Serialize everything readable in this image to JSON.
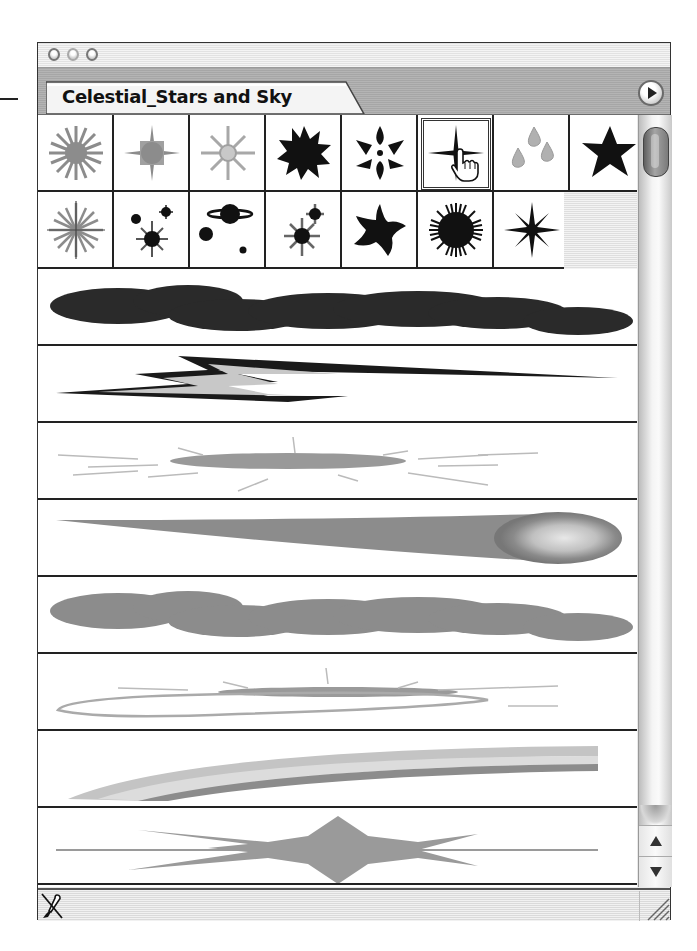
{
  "window": {
    "title_buttons": [
      "close",
      "minimize",
      "zoom"
    ],
    "tab_label": "Celestial_Stars and Sky",
    "menu_button_icon": "triangle-right-icon"
  },
  "brush_library": {
    "name": "Celestial_Stars and Sky",
    "selected_index": 5,
    "scatter_brushes": [
      {
        "name": "gray-sunburst-star",
        "icon": "sunburst-icon"
      },
      {
        "name": "gray-four-point-glow-star",
        "icon": "four-point-glow-icon"
      },
      {
        "name": "light-gray-eight-point-star",
        "icon": "eight-point-star-icon"
      },
      {
        "name": "black-twelve-point-star",
        "icon": "burst-star-icon"
      },
      {
        "name": "black-flower-star",
        "icon": "flower-star-icon"
      },
      {
        "name": "black-four-point-sparkle",
        "icon": "sparkle-icon"
      },
      {
        "name": "gray-droplets",
        "icon": "droplets-icon"
      },
      {
        "name": "black-five-point-star",
        "icon": "star-icon"
      },
      {
        "name": "gray-compass-starburst",
        "icon": "compass-star-icon"
      },
      {
        "name": "black-star-cluster",
        "icon": "star-cluster-icon"
      },
      {
        "name": "black-planets",
        "icon": "planets-icon"
      },
      {
        "name": "black-double-star-burst",
        "icon": "double-star-icon"
      },
      {
        "name": "black-curved-star",
        "icon": "curved-star-icon"
      },
      {
        "name": "black-spiky-sun",
        "icon": "spiky-sun-icon"
      },
      {
        "name": "black-eight-point-sparkle",
        "icon": "eight-point-sparkle-icon"
      }
    ],
    "art_brushes": [
      {
        "name": "dark-cloud",
        "icon": "cloud-stroke-icon"
      },
      {
        "name": "lightning-bolt",
        "icon": "lightning-stroke-icon"
      },
      {
        "name": "gray-nebula-streaks",
        "icon": "nebula-stroke-icon"
      },
      {
        "name": "comet",
        "icon": "comet-stroke-icon"
      },
      {
        "name": "gray-cloud",
        "icon": "cloud-stroke-icon"
      },
      {
        "name": "galaxy-ring",
        "icon": "galaxy-stroke-icon"
      },
      {
        "name": "rainbow-arc",
        "icon": "rainbow-stroke-icon"
      },
      {
        "name": "starburst-stroke",
        "icon": "starburst-stroke-icon"
      }
    ]
  },
  "scrollbar": {
    "up_icon": "arrow-up-icon",
    "down_icon": "arrow-down-icon"
  },
  "bottom_bar": {
    "remove_brush_icon": "remove-brush-stroke-icon",
    "resize_icon": "resize-grip-icon"
  },
  "colors": {
    "border": "#222222",
    "brush_dark": "#1a1a1a",
    "brush_gray": "#8c8c8c",
    "brush_light": "#c4c4c4"
  }
}
